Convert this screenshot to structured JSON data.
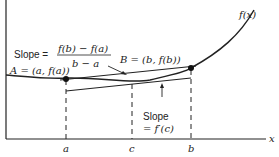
{
  "diagram": {
    "curve_label": "f(x)",
    "x_axis_label": "x",
    "point_a_label": "A = (a, f(a))",
    "point_b_label": "B = (b, f(b))",
    "secant_label": {
      "prefix": "Slope =",
      "numerator": "f(b) − f(a)",
      "denominator": "b − a"
    },
    "tangent_label": {
      "line1": "Slope",
      "line2": "= f′(c)"
    },
    "tick_labels": [
      "a",
      "c",
      "b"
    ],
    "colors": {
      "curve": "#222222",
      "axes": "#222222",
      "text": "#222222"
    }
  }
}
